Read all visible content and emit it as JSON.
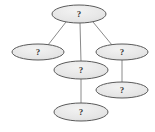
{
  "diagram": {
    "type": "node-link-graph",
    "title": "",
    "canvas": {
      "width": 155,
      "height": 132,
      "background": "#ffffff"
    },
    "style": {
      "node_fill": "#e8e8e8",
      "node_fill_highlight": "#f4f4f4",
      "node_stroke": "#5a5a5a",
      "node_stroke_width": 1,
      "edge_stroke": "#8a8a8a",
      "edge_stroke_width": 1,
      "label_color": "#3a3a3a"
    },
    "nodes": [
      {
        "id": "n1",
        "label": "?",
        "cx": 79,
        "cy": 14,
        "rx": 27,
        "ry": 9,
        "name": "node-top"
      },
      {
        "id": "n2",
        "label": "?",
        "cx": 38,
        "cy": 52,
        "rx": 26,
        "ry": 8,
        "name": "node-left"
      },
      {
        "id": "n3",
        "label": "?",
        "cx": 122,
        "cy": 52,
        "rx": 26,
        "ry": 8,
        "name": "node-right"
      },
      {
        "id": "n4",
        "label": "?",
        "cx": 81,
        "cy": 70,
        "rx": 27,
        "ry": 9,
        "name": "node-middle"
      },
      {
        "id": "n5",
        "label": "?",
        "cx": 122,
        "cy": 90,
        "rx": 26,
        "ry": 8,
        "name": "node-lower-right"
      },
      {
        "id": "n6",
        "label": "?",
        "cx": 81,
        "cy": 112,
        "rx": 27,
        "ry": 9,
        "name": "node-bottom"
      }
    ],
    "edges": [
      {
        "from": "n1",
        "to": "n2",
        "x1": 66,
        "y1": 22,
        "x2": 48,
        "y2": 45,
        "name": "edge-top-to-left"
      },
      {
        "from": "n1",
        "to": "n4",
        "x1": 80,
        "y1": 23,
        "x2": 81,
        "y2": 62,
        "name": "edge-top-to-middle"
      },
      {
        "from": "n1",
        "to": "n3",
        "x1": 93,
        "y1": 22,
        "x2": 112,
        "y2": 45,
        "name": "edge-top-to-right"
      },
      {
        "from": "n3",
        "to": "n5",
        "x1": 122,
        "y1": 60,
        "x2": 122,
        "y2": 82,
        "name": "edge-right-to-lower-right"
      },
      {
        "from": "n4",
        "to": "n6",
        "x1": 81,
        "y1": 79,
        "x2": 81,
        "y2": 104,
        "name": "edge-middle-to-bottom"
      }
    ]
  }
}
